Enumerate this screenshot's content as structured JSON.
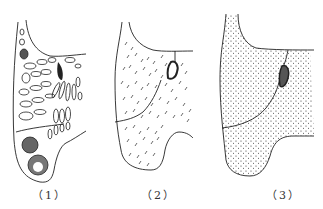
{
  "figure": {
    "panels": [
      {
        "id": 1,
        "label": "（1）",
        "texture": "coarse-cavities"
      },
      {
        "id": 2,
        "label": "（2）",
        "texture": "dashes"
      },
      {
        "id": 3,
        "label": "（3）",
        "texture": "fine-dots"
      }
    ],
    "colors": {
      "line": "#222222",
      "background": "#ffffff"
    }
  }
}
